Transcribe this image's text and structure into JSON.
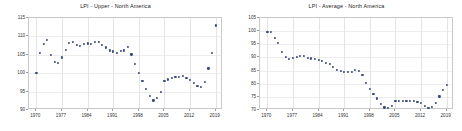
{
  "page": {
    "background_color": "#ffffff",
    "width": 462,
    "height": 131
  },
  "style": {
    "marker_color": "#3b4a7a",
    "axis_color": "#c9c9c9",
    "grid_color": "#e4e4e4",
    "text_color": "#333333",
    "title_color": "#222222"
  },
  "charts": [
    {
      "panel_name": "lpi-upper-north-america",
      "title": "LPI - Upper - North America"
    },
    {
      "panel_name": "lpi-average-north-america",
      "title": "LPI - Average - North America"
    }
  ],
  "chart_data": [
    {
      "type": "scatter",
      "title": "LPI - Upper - North America",
      "xlabel": "",
      "ylabel": "",
      "xlim": [
        1968,
        2021
      ],
      "ylim": [
        90,
        115
      ],
      "grid": true,
      "legend": false,
      "marker_color": "#3b4a7a",
      "xticks": [
        1970,
        1977,
        1984,
        1991,
        1998,
        2005,
        2012,
        2019
      ],
      "yticks": [
        90,
        95,
        100,
        105,
        110,
        115
      ],
      "x": [
        1970,
        1971,
        1972,
        1973,
        1974,
        1975,
        1976,
        1977,
        1978,
        1979,
        1980,
        1981,
        1982,
        1983,
        1984,
        1985,
        1986,
        1987,
        1988,
        1989,
        1990,
        1991,
        1992,
        1993,
        1994,
        1995,
        1996,
        1997,
        1998,
        1999,
        2000,
        2001,
        2002,
        2003,
        2004,
        2005,
        2006,
        2007,
        2008,
        2009,
        2010,
        2011,
        2012,
        2013,
        2014,
        2015,
        2016,
        2017,
        2018,
        2019
      ],
      "y": [
        100.0,
        105.5,
        108.0,
        109.0,
        105.0,
        103.0,
        102.8,
        104.3,
        106.3,
        108.3,
        108.6,
        107.7,
        107.5,
        108.0,
        108.1,
        108.0,
        108.4,
        108.5,
        107.6,
        107.0,
        106.2,
        105.9,
        105.5,
        106.0,
        106.2,
        107.2,
        105.1,
        102.5,
        100.1,
        98.0,
        95.8,
        93.9,
        92.6,
        93.3,
        95.0,
        97.8,
        98.3,
        98.8,
        99.0,
        99.1,
        99.2,
        98.8,
        98.2,
        97.3,
        96.5,
        96.3,
        97.7,
        101.3,
        105.6,
        113.0
      ],
      "values_note": "dot positions read from axis gridlines"
    },
    {
      "type": "scatter",
      "title": "LPI - Average - North America",
      "xlabel": "",
      "ylabel": "",
      "xlim": [
        1968,
        2021
      ],
      "ylim": [
        70,
        105
      ],
      "grid": true,
      "legend": false,
      "marker_color": "#3b4a7a",
      "xticks": [
        1970,
        1977,
        1984,
        1991,
        1998,
        2005,
        2012,
        2019
      ],
      "yticks": [
        70,
        75,
        80,
        85,
        90,
        95,
        100,
        105
      ],
      "x": [
        1970,
        1971,
        1972,
        1973,
        1974,
        1975,
        1976,
        1977,
        1978,
        1979,
        1980,
        1981,
        1982,
        1983,
        1984,
        1985,
        1986,
        1987,
        1988,
        1989,
        1990,
        1991,
        1992,
        1993,
        1994,
        1995,
        1996,
        1997,
        1998,
        1999,
        2000,
        2001,
        2002,
        2003,
        2004,
        2005,
        2006,
        2007,
        2008,
        2009,
        2010,
        2011,
        2012,
        2013,
        2014,
        2015,
        2016,
        2017,
        2018,
        2019
      ],
      "y": [
        99.7,
        99.6,
        97.4,
        95.4,
        92.0,
        90.1,
        89.4,
        89.8,
        90.3,
        90.7,
        90.6,
        89.9,
        89.6,
        89.3,
        89.0,
        88.6,
        88.0,
        87.4,
        86.4,
        85.2,
        84.9,
        84.4,
        84.4,
        84.4,
        85.1,
        84.9,
        83.2,
        80.2,
        78.0,
        76.2,
        74.4,
        72.4,
        71.0,
        70.9,
        71.5,
        73.4,
        73.5,
        73.6,
        73.5,
        73.6,
        73.5,
        73.2,
        72.6,
        71.6,
        70.7,
        71.1,
        72.7,
        75.2,
        77.7,
        79.6
      ],
      "values_note": "dot positions read from axis gridlines"
    }
  ]
}
